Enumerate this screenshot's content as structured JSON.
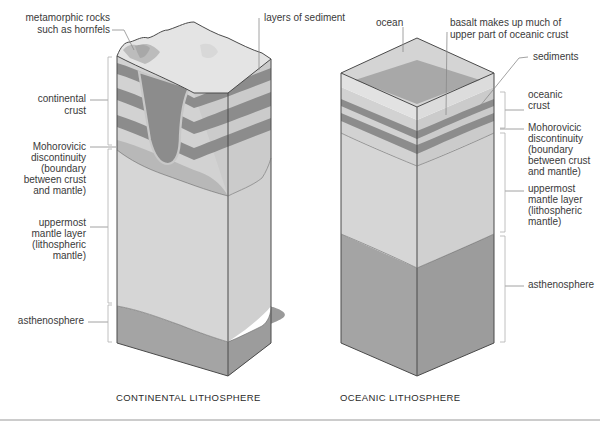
{
  "diagram": {
    "colors": {
      "top_surface": "#e4e4e4",
      "light_layer": "#d2d2d2",
      "dark_layer": "#8c8c8c",
      "intrusion": "#8c8c8c",
      "intrusion_rim": "#c8c8c8",
      "mantle": "#d6d6d6",
      "asthenosphere": "#a4a4a4",
      "ocean": "#d0d0d0",
      "basalt_top": "#a8a8a8",
      "outline": "#4a4a4a"
    },
    "continental": {
      "caption": "CONTINENTAL LITHOSPHERE",
      "labels": {
        "metamorphic_line1": "metamorphic rocks",
        "metamorphic_line2": "such as hornfels",
        "sediment_layers": "layers of sediment",
        "crust_line1": "continental",
        "crust_line2": "crust",
        "moho_line1": "Mohorovicic",
        "moho_line2": "discontinuity",
        "moho_line3": "(boundary",
        "moho_line4": "between crust",
        "moho_line5": "and mantle)",
        "mantle_line1": "uppermost",
        "mantle_line2": "mantle layer",
        "mantle_line3": "(lithospheric",
        "mantle_line4": "mantle)",
        "asthenosphere": "asthenosphere"
      }
    },
    "oceanic": {
      "caption": "OCEANIC LITHOSPHERE",
      "labels": {
        "ocean": "ocean",
        "basalt_line1": "basalt makes up much of",
        "basalt_line2": "upper part of oceanic crust",
        "sediments": "sediments",
        "crust_line1": "oceanic",
        "crust_line2": "crust",
        "moho_line1": "Mohorovicic",
        "moho_line2": "discontinuity",
        "moho_line3": "(boundary",
        "moho_line4": "between crust",
        "moho_line5": "and mantle)",
        "mantle_line1": "uppermost",
        "mantle_line2": "mantle layer",
        "mantle_line3": "(lithospheric",
        "mantle_line4": "mantle)",
        "asthenosphere": "asthenosphere"
      }
    }
  }
}
